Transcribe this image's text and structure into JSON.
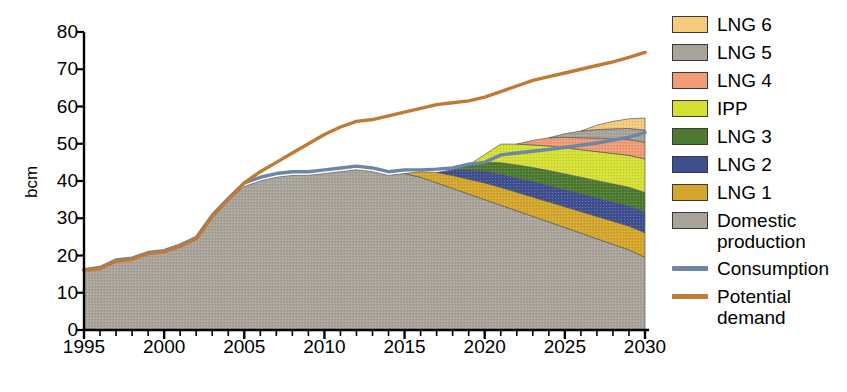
{
  "chart_data": {
    "type": "area",
    "title": "",
    "subtitle": "",
    "xlabel": "",
    "ylabel": "bcm",
    "xlim": [
      1995,
      2030
    ],
    "ylim": [
      0,
      80
    ],
    "grid": false,
    "legend_position": "right",
    "yticks": [
      80,
      70,
      60,
      50,
      40,
      30,
      20,
      10,
      0
    ],
    "xticks": [
      1995,
      2000,
      2005,
      2010,
      2015,
      2020,
      2025,
      2030
    ],
    "x_minor_tick_step": 1,
    "x": [
      1995,
      1996,
      1997,
      1998,
      1999,
      2000,
      2001,
      2002,
      2003,
      2004,
      2005,
      2006,
      2007,
      2008,
      2009,
      2010,
      2011,
      2012,
      2013,
      2014,
      2015,
      2016,
      2017,
      2018,
      2019,
      2020,
      2021,
      2022,
      2023,
      2024,
      2025,
      2026,
      2027,
      2028,
      2029,
      2030
    ],
    "stacked": true,
    "stack_order_bottom_to_top": [
      "Domestic production",
      "LNG 1",
      "LNG 2",
      "LNG 3",
      "IPP",
      "LNG 4",
      "LNG 5",
      "LNG 6"
    ],
    "series": [
      {
        "name": "Domestic production",
        "type": "area",
        "color": "#a8a49b",
        "values": [
          16.0,
          16.5,
          18.5,
          19.0,
          20.5,
          21.0,
          22.5,
          24.5,
          30.5,
          35.0,
          38.5,
          40.0,
          41.0,
          41.5,
          41.5,
          42.0,
          42.5,
          43.0,
          42.5,
          41.5,
          42.0,
          41.0,
          39.5,
          38.0,
          36.5,
          35.0,
          33.5,
          32.0,
          30.5,
          29.0,
          27.5,
          26.0,
          24.5,
          23.0,
          21.5,
          19.5
        ]
      },
      {
        "name": "LNG 1",
        "type": "area",
        "color": "#d4a72c",
        "values": [
          0,
          0,
          0,
          0,
          0,
          0,
          0,
          0,
          0,
          0,
          0,
          0,
          0,
          0,
          0,
          0,
          0,
          0,
          0,
          0,
          0,
          1.5,
          2.8,
          3.5,
          4.0,
          4.5,
          4.8,
          5.0,
          5.2,
          5.4,
          5.6,
          5.8,
          6.0,
          6.2,
          6.4,
          6.6
        ]
      },
      {
        "name": "LNG 2",
        "type": "area",
        "color": "#3f4f8f",
        "values": [
          0,
          0,
          0,
          0,
          0,
          0,
          0,
          0,
          0,
          0,
          0,
          0,
          0,
          0,
          0,
          0,
          0,
          0,
          0,
          0,
          0,
          0,
          0,
          1.5,
          2.6,
          3.2,
          3.6,
          3.9,
          4.2,
          4.4,
          4.6,
          4.8,
          5.0,
          5.2,
          5.4,
          5.6
        ]
      },
      {
        "name": "LNG 3",
        "type": "area",
        "color": "#4c7a2e",
        "values": [
          0,
          0,
          0,
          0,
          0,
          0,
          0,
          0,
          0,
          0,
          0,
          0,
          0,
          0,
          0,
          0,
          0,
          0,
          0,
          0,
          0,
          0,
          0,
          0,
          1.2,
          2.4,
          3.0,
          3.4,
          3.7,
          4.0,
          4.2,
          4.4,
          4.6,
          4.8,
          5.0,
          5.2
        ]
      },
      {
        "name": "IPP",
        "type": "area",
        "color": "#d4e033",
        "values": [
          0,
          0,
          0,
          0,
          0,
          0,
          0,
          0,
          0,
          0,
          0,
          0,
          0,
          0,
          0,
          0,
          0,
          0,
          0,
          0,
          0,
          0,
          0,
          0,
          0,
          2.0,
          5.0,
          5.6,
          6.1,
          6.6,
          7.0,
          7.4,
          7.8,
          8.2,
          8.6,
          9.0
        ]
      },
      {
        "name": "LNG 4",
        "type": "area",
        "color": "#ef9b75",
        "values": [
          0,
          0,
          0,
          0,
          0,
          0,
          0,
          0,
          0,
          0,
          0,
          0,
          0,
          0,
          0,
          0,
          0,
          0,
          0,
          0,
          0,
          0,
          0,
          0,
          0,
          0,
          0,
          0,
          1.2,
          2.2,
          2.8,
          3.2,
          3.6,
          3.9,
          4.2,
          4.5
        ]
      },
      {
        "name": "LNG 5",
        "type": "area",
        "color": "#a8a49b",
        "values": [
          0,
          0,
          0,
          0,
          0,
          0,
          0,
          0,
          0,
          0,
          0,
          0,
          0,
          0,
          0,
          0,
          0,
          0,
          0,
          0,
          0,
          0,
          0,
          0,
          0,
          0,
          0,
          0,
          0,
          0,
          1.0,
          1.8,
          2.3,
          2.7,
          3.0,
          3.3
        ]
      },
      {
        "name": "LNG 6",
        "type": "area",
        "color": "#f5cb7d",
        "values": [
          0,
          0,
          0,
          0,
          0,
          0,
          0,
          0,
          0,
          0,
          0,
          0,
          0,
          0,
          0,
          0,
          0,
          0,
          0,
          0,
          0,
          0,
          0,
          0,
          0,
          0,
          0,
          0,
          0,
          0,
          0,
          0,
          1.2,
          2.0,
          2.6,
          3.2
        ]
      },
      {
        "name": "Consumption",
        "type": "line",
        "color": "#6b86a8",
        "values": [
          16.2,
          16.8,
          18.8,
          19.3,
          20.8,
          21.3,
          22.8,
          24.8,
          30.8,
          35.3,
          39.5,
          41.0,
          42.0,
          42.5,
          42.5,
          43.0,
          43.5,
          44.0,
          43.5,
          42.5,
          43.0,
          43.0,
          43.2,
          43.5,
          44.5,
          45.0,
          47.0,
          47.5,
          48.0,
          48.5,
          49.0,
          49.6,
          50.2,
          50.9,
          51.8,
          53.0
        ]
      },
      {
        "name": "Potential demand",
        "type": "line",
        "color": "#c07a34",
        "values": [
          16.0,
          16.5,
          18.5,
          19.0,
          20.5,
          21.0,
          22.5,
          24.5,
          30.5,
          35.0,
          39.5,
          42.5,
          45.0,
          47.5,
          50.0,
          52.5,
          54.5,
          56.0,
          56.5,
          57.5,
          58.5,
          59.5,
          60.5,
          61.0,
          61.5,
          62.5,
          64.0,
          65.5,
          67.0,
          68.0,
          69.0,
          70.0,
          71.0,
          72.0,
          73.2,
          74.5
        ]
      }
    ]
  },
  "axes": {
    "y_label": "bcm",
    "y_tick_labels": [
      "80",
      "70",
      "60",
      "50",
      "40",
      "30",
      "20",
      "10",
      "0"
    ],
    "x_tick_labels": [
      "1995",
      "2000",
      "2005",
      "2010",
      "2015",
      "2020",
      "2025",
      "2030"
    ]
  },
  "legend": {
    "items": [
      {
        "label": "LNG 6",
        "color": "#f5cb7d",
        "kind": "swatch"
      },
      {
        "label": "LNG 5",
        "color": "#a8a49b",
        "kind": "swatch"
      },
      {
        "label": "LNG 4",
        "color": "#ef9b75",
        "kind": "swatch"
      },
      {
        "label": "IPP",
        "color": "#d4e033",
        "kind": "swatch"
      },
      {
        "label": "LNG 3",
        "color": "#4c7a2e",
        "kind": "swatch"
      },
      {
        "label": "LNG 2",
        "color": "#3f4f8f",
        "kind": "swatch"
      },
      {
        "label": "LNG 1",
        "color": "#d4a72c",
        "kind": "swatch"
      },
      {
        "label": "Domestic\nproduction",
        "color": "#a8a49b",
        "kind": "swatch"
      },
      {
        "label": "Consumption",
        "color": "#6b86a8",
        "kind": "line"
      },
      {
        "label": "Potential\ndemand",
        "color": "#c07a34",
        "kind": "line"
      }
    ]
  },
  "colors": {
    "axis": "#000000",
    "background": "#ffffff",
    "consumption": "#6b86a8",
    "potential_demand": "#c07a34"
  }
}
